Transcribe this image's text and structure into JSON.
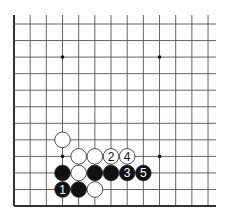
{
  "diagram": {
    "type": "go-board-partial",
    "columns": 13,
    "rows": 12,
    "edges": {
      "left": true,
      "bottom": true,
      "top": false,
      "right": false
    },
    "colors": {
      "line": "#555555",
      "edge": "#333333",
      "black": "#111111",
      "white": "#ffffff",
      "stone_outline": "#222222"
    },
    "star_points": [
      [
        3,
        2
      ],
      [
        9,
        2
      ],
      [
        3,
        8
      ],
      [
        9,
        8
      ]
    ],
    "stones": [
      {
        "col": 3,
        "row": 7,
        "color": "white",
        "label": ""
      },
      {
        "col": 4,
        "row": 8,
        "color": "white",
        "label": ""
      },
      {
        "col": 5,
        "row": 8,
        "color": "white",
        "label": ""
      },
      {
        "col": 6,
        "row": 8,
        "color": "white",
        "label": "2"
      },
      {
        "col": 7,
        "row": 8,
        "color": "white",
        "label": "4"
      },
      {
        "col": 3,
        "row": 9,
        "color": "black",
        "label": ""
      },
      {
        "col": 4,
        "row": 9,
        "color": "white",
        "label": ""
      },
      {
        "col": 5,
        "row": 9,
        "color": "black",
        "label": ""
      },
      {
        "col": 6,
        "row": 9,
        "color": "black",
        "label": ""
      },
      {
        "col": 7,
        "row": 9,
        "color": "black",
        "label": "3"
      },
      {
        "col": 8,
        "row": 9,
        "color": "black",
        "label": "5"
      },
      {
        "col": 3,
        "row": 10,
        "color": "black",
        "label": "1"
      },
      {
        "col": 4,
        "row": 10,
        "color": "black",
        "label": ""
      },
      {
        "col": 5,
        "row": 10,
        "color": "white",
        "label": ""
      }
    ]
  }
}
